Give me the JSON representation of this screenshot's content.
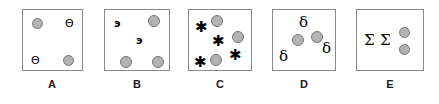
{
  "figure": {
    "background_color": "#ffffff",
    "panel_border_color": "#8a8a8a",
    "dot_fill_color": "#b3b3b3",
    "dot_border_color": "#777777",
    "glyph_color": "#000000",
    "panel_count": 5
  },
  "panels": [
    {
      "id": "A",
      "label": "A",
      "box": {
        "x": 22,
        "y": 9,
        "w": 61,
        "h": 62
      },
      "items": [
        {
          "kind": "circle",
          "name": "gray-circle",
          "x": 31,
          "y": 17,
          "d": 11
        },
        {
          "kind": "glyph",
          "name": "theta-symbol",
          "text": "Θ",
          "class": "theta",
          "x": 64,
          "y": 17
        },
        {
          "kind": "glyph",
          "name": "theta-symbol",
          "text": "Θ",
          "class": "theta",
          "x": 30,
          "y": 54
        },
        {
          "kind": "circle",
          "name": "gray-circle",
          "x": 62,
          "y": 54,
          "d": 11
        }
      ]
    },
    {
      "id": "B",
      "label": "B",
      "box": {
        "x": 104,
        "y": 9,
        "w": 66,
        "h": 62
      },
      "items": [
        {
          "kind": "glyph",
          "name": "reversed-e-symbol",
          "text": "э",
          "class": "ecyr",
          "x": 113,
          "y": 17
        },
        {
          "kind": "circle",
          "name": "gray-circle",
          "x": 147,
          "y": 14,
          "d": 12
        },
        {
          "kind": "glyph",
          "name": "reversed-e-symbol",
          "text": "э",
          "class": "ecyr",
          "x": 135,
          "y": 34
        },
        {
          "kind": "circle",
          "name": "gray-circle",
          "x": 119,
          "y": 55,
          "d": 12
        },
        {
          "kind": "circle",
          "name": "gray-circle",
          "x": 151,
          "y": 55,
          "d": 12
        }
      ]
    },
    {
      "id": "C",
      "label": "C",
      "box": {
        "x": 188,
        "y": 9,
        "w": 64,
        "h": 62
      },
      "items": [
        {
          "kind": "glyph",
          "name": "asterisk-symbol",
          "text": "✱",
          "class": "star",
          "x": 194,
          "y": 19
        },
        {
          "kind": "circle",
          "name": "gray-circle",
          "x": 210,
          "y": 14,
          "d": 12
        },
        {
          "kind": "glyph",
          "name": "asterisk-symbol",
          "text": "✱",
          "class": "star",
          "x": 211,
          "y": 33
        },
        {
          "kind": "circle",
          "name": "gray-circle",
          "x": 231,
          "y": 30,
          "d": 12
        },
        {
          "kind": "glyph",
          "name": "asterisk-symbol",
          "text": "✱",
          "class": "star",
          "x": 228,
          "y": 47
        },
        {
          "kind": "circle",
          "name": "gray-circle",
          "x": 209,
          "y": 53,
          "d": 12
        },
        {
          "kind": "glyph",
          "name": "asterisk-symbol",
          "text": "✱",
          "class": "star",
          "x": 193,
          "y": 54
        }
      ]
    },
    {
      "id": "D",
      "label": "D",
      "box": {
        "x": 272,
        "y": 9,
        "w": 64,
        "h": 62
      },
      "items": [
        {
          "kind": "glyph",
          "name": "delta-symbol",
          "text": "δ",
          "class": "delta",
          "x": 298,
          "y": 14
        },
        {
          "kind": "circle",
          "name": "gray-circle",
          "x": 291,
          "y": 33,
          "d": 12
        },
        {
          "kind": "circle",
          "name": "gray-circle",
          "x": 310,
          "y": 30,
          "d": 12
        },
        {
          "kind": "glyph",
          "name": "delta-symbol",
          "text": "δ",
          "class": "delta",
          "x": 321,
          "y": 40
        },
        {
          "kind": "glyph",
          "name": "delta-symbol",
          "text": "δ",
          "class": "delta",
          "x": 278,
          "y": 48
        }
      ]
    },
    {
      "id": "E",
      "label": "E",
      "box": {
        "x": 356,
        "y": 9,
        "w": 68,
        "h": 62
      },
      "items": [
        {
          "kind": "glyph",
          "name": "sigma-symbol",
          "text": "Σ",
          "class": "sigma",
          "x": 363,
          "y": 32
        },
        {
          "kind": "glyph",
          "name": "sigma-symbol",
          "text": "Σ",
          "class": "sigma",
          "x": 379,
          "y": 32
        },
        {
          "kind": "circle",
          "name": "gray-circle",
          "x": 398,
          "y": 26,
          "d": 11
        },
        {
          "kind": "circle",
          "name": "gray-circle",
          "x": 398,
          "y": 43,
          "d": 11
        }
      ]
    }
  ],
  "labels_row": {
    "y": 77,
    "items": [
      {
        "text": "A",
        "cx": 52
      },
      {
        "text": "B",
        "cx": 137
      },
      {
        "text": "C",
        "cx": 220
      },
      {
        "text": "D",
        "cx": 304
      },
      {
        "text": "E",
        "cx": 390
      }
    ]
  }
}
